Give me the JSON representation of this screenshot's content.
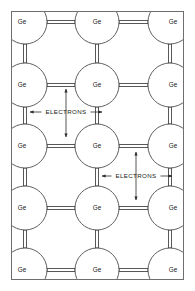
{
  "figure": {
    "background_color": "#ffffff",
    "frame": {
      "x": 11,
      "y": 11,
      "width": 173,
      "height": 269,
      "stroke_color": "#6e6e6e",
      "stroke_width": 1
    }
  },
  "lattice": {
    "atom_label": "Ge",
    "atom_radius": 22,
    "atom_stroke_color": "#4d4d4d",
    "atom_fill_color": "#ffffff",
    "bond_stroke_color": "#3a3a3a",
    "bond_gap": 3,
    "columns_x": [
      25,
      97,
      170
    ],
    "rows_y": [
      22,
      85,
      146,
      208,
      270
    ],
    "atoms": [
      {
        "id": "a-0-0",
        "label": "Ge",
        "cx": 25,
        "cy": 22,
        "r": 22
      },
      {
        "id": "a-0-1",
        "label": "Ge",
        "cx": 97,
        "cy": 22,
        "r": 22
      },
      {
        "id": "a-0-2",
        "label": "Ge",
        "cx": 170,
        "cy": 22,
        "r": 22
      },
      {
        "id": "a-1-0",
        "label": "Ge",
        "cx": 25,
        "cy": 85,
        "r": 22
      },
      {
        "id": "a-1-1",
        "label": "Ge",
        "cx": 97,
        "cy": 85,
        "r": 22
      },
      {
        "id": "a-1-2",
        "label": "Ge",
        "cx": 170,
        "cy": 85,
        "r": 22
      },
      {
        "id": "a-2-0",
        "label": "Ge",
        "cx": 25,
        "cy": 146,
        "r": 22
      },
      {
        "id": "a-2-1",
        "label": "Ge",
        "cx": 97,
        "cy": 146,
        "r": 22
      },
      {
        "id": "a-2-2",
        "label": "Ge",
        "cx": 170,
        "cy": 146,
        "r": 22
      },
      {
        "id": "a-3-0",
        "label": "Ge",
        "cx": 25,
        "cy": 208,
        "r": 22
      },
      {
        "id": "a-3-1",
        "label": "Ge",
        "cx": 97,
        "cy": 208,
        "r": 22
      },
      {
        "id": "a-3-2",
        "label": "Ge",
        "cx": 170,
        "cy": 208,
        "r": 22
      },
      {
        "id": "a-4-0",
        "label": "Ge",
        "cx": 25,
        "cy": 270,
        "r": 22
      },
      {
        "id": "a-4-1",
        "label": "Ge",
        "cx": 97,
        "cy": 270,
        "r": 22
      },
      {
        "id": "a-4-2",
        "label": "Ge",
        "cx": 170,
        "cy": 270,
        "r": 22
      }
    ],
    "label_offsets": {
      "left_column_dx": -3,
      "right_column_dx": 3,
      "center_column_dx": 0
    }
  },
  "annotations": [
    {
      "id": "electrons-upper-left",
      "text": "ELECTRONS",
      "text_x": 66,
      "text_y": 112,
      "horizontal_arrow": {
        "x1": 30,
        "x2": 102,
        "y": 112
      },
      "vertical_arrow": {
        "x": 66,
        "y1": 89,
        "y2": 137
      }
    },
    {
      "id": "electrons-lower-right",
      "text": "ELECTRONS",
      "text_x": 136,
      "text_y": 176,
      "horizontal_arrow": {
        "x1": 102,
        "x2": 172,
        "y": 176
      },
      "vertical_arrow": {
        "x": 136,
        "y1": 152,
        "y2": 200
      }
    }
  ]
}
